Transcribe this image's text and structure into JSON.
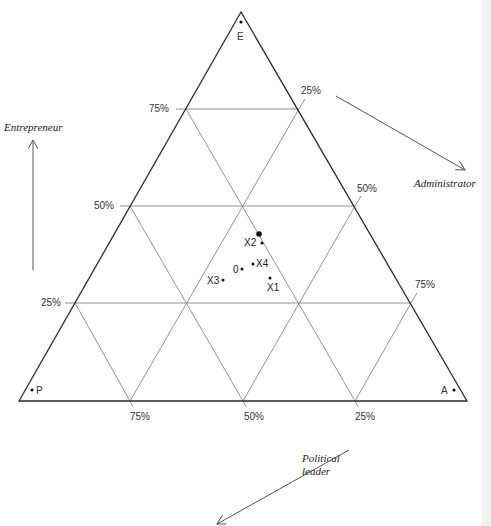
{
  "diagram": {
    "type": "ternary-triangle",
    "vertices": {
      "top": {
        "label": "E"
      },
      "bottom_left": {
        "label": "P"
      },
      "bottom_right": {
        "label": "A"
      }
    },
    "axes": {
      "entrepreneur": {
        "label": "Entrepreneur",
        "direction": "up"
      },
      "administrator": {
        "label": "Administrator",
        "direction": "down-right"
      },
      "political_leader": {
        "label": "Political\nleader",
        "line1": "Political",
        "line2": "leader",
        "direction": "down-left"
      }
    },
    "ticks": {
      "left": [
        "75%",
        "50%",
        "25%"
      ],
      "right": [
        "25%",
        "50%",
        "75%"
      ],
      "bottom": [
        "75%",
        "50%",
        "25%"
      ]
    },
    "points": [
      {
        "label": "",
        "note": "large dot"
      },
      {
        "label": "X2"
      },
      {
        "label": "X4"
      },
      {
        "label": "0"
      },
      {
        "label": "X3"
      },
      {
        "label": "X1"
      }
    ],
    "colors": {
      "line": "#2b2b2b",
      "grid": "#6a6a6a",
      "text": "#333333"
    }
  }
}
